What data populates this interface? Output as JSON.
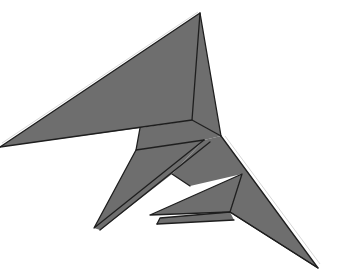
{
  "figure": {
    "alt": "Origami model diagram: gray folded paper shape resembling a bird or pterodactyl with a long pointed wing to the upper-left and layered claw flaps pointing down-left",
    "colors": {
      "paper": "#6e6e6e",
      "crease": "#1e1e1e",
      "highlight": "#d8d8d8",
      "background": "#ffffff"
    }
  }
}
